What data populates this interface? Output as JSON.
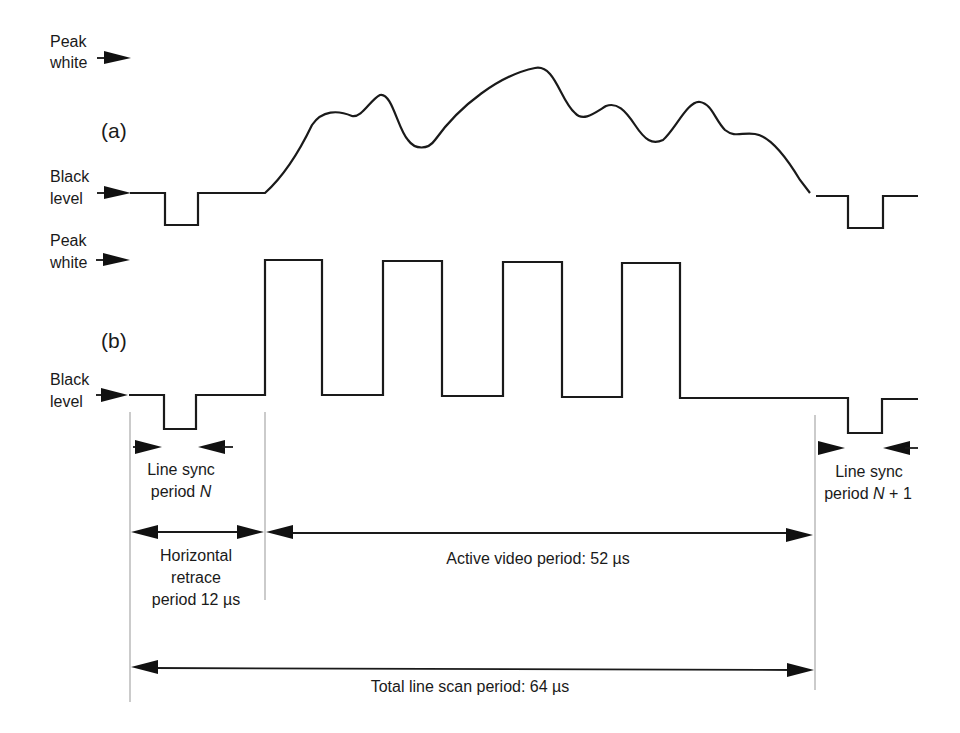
{
  "figure": {
    "level_labels": {
      "peak_line1": "Peak",
      "peak_line2": "white",
      "black_line1": "Black",
      "black_line2": "level"
    },
    "panels": [
      {
        "id": "a",
        "label": "(a)",
        "description": "Arbitrary analog video line waveform"
      },
      {
        "id": "b",
        "label": "(b)",
        "description": "Square-wave test pattern (alternating peak white / black bars)"
      }
    ],
    "annotations": {
      "line_sync_n_line1": "Line sync",
      "line_sync_n_line2": "period ",
      "line_sync_n_var": "N",
      "line_sync_n1_line1": "Line sync",
      "line_sync_n1_line2": "period ",
      "line_sync_n1_var": "N",
      "line_sync_n1_suffix": " + 1",
      "horizontal_line1": "Horizontal",
      "horizontal_line2": "retrace",
      "horizontal_line3": "period 12 µs",
      "active_video": "Active video period: 52 µs",
      "total_line": "Total line scan period: 64 µs"
    },
    "timing_us": {
      "horizontal_retrace": 12,
      "active_video": 52,
      "total_line_scan": 64
    },
    "colors": {
      "ink": "#1a1a1a",
      "guide": "#a8a8a8",
      "background": "#ffffff"
    }
  }
}
